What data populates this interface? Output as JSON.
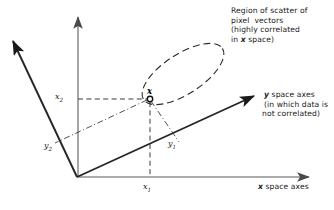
{
  "figure": {
    "type": "diagram",
    "background": "#ffffff",
    "ink_color": "#1a1a1a",
    "axis_gray": "#8a8a8a"
  },
  "annotations": {
    "region": {
      "line1": "Region of scatter of",
      "line2": "pixel  vectors",
      "line3": "(highly correlated",
      "line4_prefix": "in ",
      "line4_symbol": "x",
      "line4_suffix": " space)"
    },
    "y_axes": {
      "symbol": "y",
      "title_suffix": " space axes",
      "line2": "(in which data is",
      "line3": "not correlated)"
    },
    "x_axes": {
      "symbol": "x",
      "title_suffix": " space axes"
    }
  },
  "axis_labels": {
    "x1": {
      "symbol": "x",
      "subscript": "1"
    },
    "x2": {
      "symbol": "x",
      "subscript": "2"
    },
    "y1": {
      "symbol": "y",
      "subscript": "1"
    },
    "y2": {
      "symbol": "y",
      "subscript": "2"
    }
  },
  "point": {
    "label": "x",
    "marker": "open-circle"
  },
  "geometry": {
    "origin": [
      77,
      177
    ],
    "x_axis_end": [
      312,
      177
    ],
    "x2_axis_top": [
      78,
      14
    ],
    "y1_axis_end": [
      258,
      94
    ],
    "y2_axis_end": [
      9,
      38
    ],
    "point_xy": [
      150,
      99
    ],
    "x1_foot": [
      150,
      177
    ],
    "ellipse_center": [
      183,
      74
    ],
    "ellipse_rx": 47,
    "ellipse_ry": 20,
    "ellipse_rotation_deg": -33
  }
}
